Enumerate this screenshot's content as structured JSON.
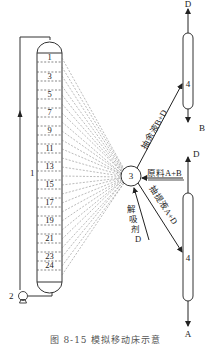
{
  "diagram": {
    "column": {
      "label": "1",
      "tray_labels": [
        "1",
        "3",
        "5",
        "7",
        "9",
        "11",
        "13",
        "15",
        "17",
        "19",
        "21",
        "23",
        "24"
      ]
    },
    "pump": {
      "label": "2"
    },
    "rotary_valve": {
      "label": "3"
    },
    "separators": [
      {
        "label": "4",
        "top_product": "D",
        "bottom_product": "B"
      },
      {
        "label": "4",
        "top_product": "D",
        "bottom_product": "A"
      }
    ],
    "streams": {
      "raffinate": "抽余液B+D",
      "feed": "原料A+B",
      "extract": "抽提液A+D",
      "desorbent": [
        "解",
        "吸",
        "剂",
        "D"
      ]
    },
    "caption": "图 8-15   模拟移动床示意"
  }
}
